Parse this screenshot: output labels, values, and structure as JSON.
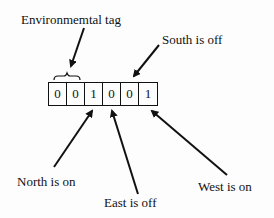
{
  "diagram": {
    "bits": [
      "0",
      "0",
      "1",
      "0",
      "0",
      "1"
    ],
    "labels": {
      "environmental_tag": "Environmemtal tag",
      "south": "South is off",
      "north": "North is on",
      "east": "East is off",
      "west": "West is on"
    },
    "colors": {
      "ink": "#111111",
      "background": "#fdfdfd"
    }
  }
}
